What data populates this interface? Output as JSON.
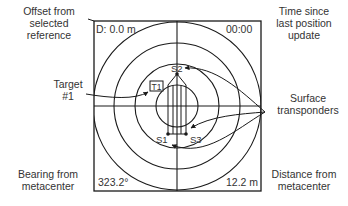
{
  "display": {
    "offset_value": "D: 0.0 m",
    "time_value": "00:00",
    "bearing_value": "323.2°",
    "distance_value": "12.2 m"
  },
  "callouts": {
    "offset": "Offset from selected reference",
    "offset_lines": [
      "Offset from",
      "selected",
      "reference"
    ],
    "time": "Time since last position update",
    "time_lines": [
      "Time since",
      "last position",
      "update"
    ],
    "target": "Target #1",
    "target_lines": [
      "Target",
      "#1"
    ],
    "surface": "Surface transponders",
    "surface_lines": [
      "Surface",
      "transponders"
    ],
    "bearing": "Bearing from metacenter",
    "bearing_lines": [
      "Bearing from",
      "metacenter"
    ],
    "distance": "Distance from metacenter",
    "distance_lines": [
      "Distance from",
      "metacenter"
    ]
  },
  "markers": {
    "target": "T1",
    "transponders": [
      "S1",
      "S2",
      "S3"
    ]
  },
  "colors": {
    "line": "#1a1a1a",
    "text": "#333333",
    "background": "#ffffff"
  }
}
